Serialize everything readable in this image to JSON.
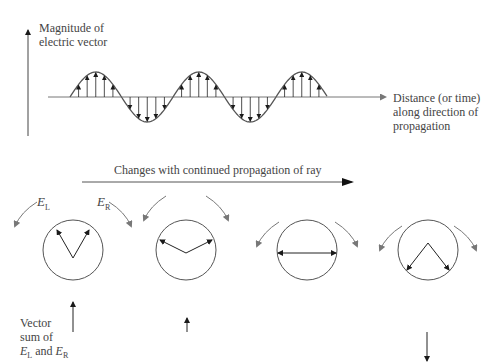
{
  "labels": {
    "y_axis_line1": "Magnitude of",
    "y_axis_line2": "electric vector",
    "x_axis_line1": "Distance (or time)",
    "x_axis_line2": "along direction of",
    "x_axis_line3": "propagation",
    "propagation_caption": "Changes with continued propagation of ray",
    "left_component": "E",
    "left_component_sub": "L",
    "right_component": "E",
    "right_component_sub": "R",
    "vector_sum_line1": "Vector",
    "vector_sum_line2": "sum of",
    "vector_sum_line3_a": "E",
    "vector_sum_line3_a_sub": "L",
    "vector_sum_line3_mid": " and ",
    "vector_sum_line3_b": "E",
    "vector_sum_line3_b_sub": "R"
  },
  "wave": {
    "cycles": 2.5,
    "arrows_per_half_cycle": 5
  },
  "stages": [
    {
      "angle_between_vectors_deg": 70,
      "resultant": "up-long"
    },
    {
      "angle_between_vectors_deg": 140,
      "resultant": "up-short"
    },
    {
      "angle_between_vectors_deg": 180,
      "resultant": "zero"
    },
    {
      "angle_between_vectors_deg": 280,
      "resultant": "down-long"
    }
  ],
  "colors": {
    "line": "#555555",
    "arrow": "#1a1a1a",
    "rotation_arrow": "#777777"
  }
}
